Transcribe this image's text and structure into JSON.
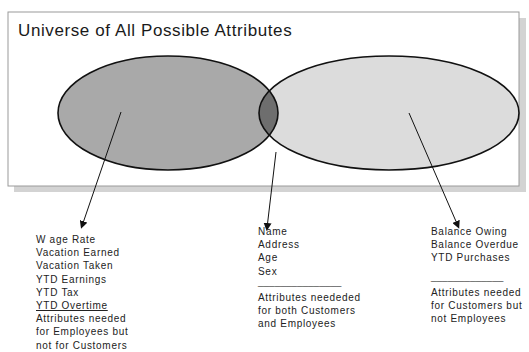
{
  "title": "Universe of All Possible Attributes",
  "colors": {
    "employees_only_fill": "#a9a9a9",
    "customers_only_fill": "#dcdcdc",
    "overlap_fill": "#6e6e6e",
    "outline": "#111111",
    "frame": "#9a9a9a",
    "shadow": "#cfcfcf"
  },
  "sets": [
    {
      "name": "Employees",
      "region": "left-ellipse"
    },
    {
      "name": "Customers",
      "region": "right-ellipse"
    }
  ],
  "groups": {
    "employees_only": {
      "items": [
        "W age Rate",
        "Vacation Earned",
        "Vacation Taken",
        "YTD Earnings",
        "YTD Tax",
        "YTD Overtime"
      ],
      "caption": [
        "Attributes needed",
        "for Employees but",
        "not for Customers"
      ]
    },
    "both": {
      "items": [
        "Name",
        "Address",
        "Age",
        "Sex"
      ],
      "separator": "_______________",
      "caption": [
        "Attributes neededed",
        "for both Customers",
        "and Employees"
      ]
    },
    "customers_only": {
      "items": [
        "Balance Owing",
        "Balance Overdue",
        "YTD Purchases"
      ],
      "separator": "_____________",
      "caption": [
        "Attributes needed",
        "for Customers but",
        "not Employees"
      ]
    }
  }
}
